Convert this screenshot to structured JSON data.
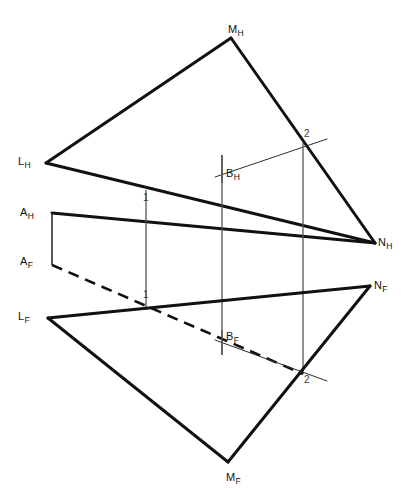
{
  "drawing": {
    "title": "Descriptive geometry: plane LMN with line AB, piercing points 1 and 2",
    "width": 412,
    "height": 501,
    "background": "#ffffff",
    "stroke_heavy": "#111111",
    "stroke_light": "#4a4a4a",
    "stroke_projector": "#555555"
  },
  "labels": {
    "m_h": {
      "text": "M",
      "sub": "H",
      "x": 228,
      "y": 24
    },
    "l_h": {
      "text": "L",
      "sub": "H",
      "x": 18,
      "y": 156
    },
    "n_h": {
      "text": "N",
      "sub": "H",
      "x": 378,
      "y": 237
    },
    "b_h": {
      "text": "B",
      "sub": "H",
      "x": 226,
      "y": 168
    },
    "a_h": {
      "text": "A",
      "sub": "H",
      "x": 20,
      "y": 207
    },
    "a_f": {
      "text": "A",
      "sub": "F",
      "x": 20,
      "y": 256
    },
    "l_f": {
      "text": "L",
      "sub": "F",
      "x": 18,
      "y": 311
    },
    "n_f": {
      "text": "N",
      "sub": "F",
      "x": 374,
      "y": 280
    },
    "b_f": {
      "text": "B",
      "sub": "F",
      "x": 226,
      "y": 331
    },
    "m_f": {
      "text": "M",
      "sub": "F",
      "x": 226,
      "y": 472
    },
    "one_h": {
      "text": "1",
      "x": 143,
      "y": 193
    },
    "two_h": {
      "text": "2",
      "x": 304,
      "y": 129
    },
    "one_f": {
      "text": "1",
      "x": 143,
      "y": 290
    },
    "two_f": {
      "text": "2",
      "x": 304,
      "y": 375
    }
  },
  "points": {
    "M_H": [
      231,
      38
    ],
    "L_H": [
      46,
      163
    ],
    "N_H": [
      375,
      243
    ],
    "A_H": [
      52,
      213
    ],
    "B_H": [
      222,
      175
    ],
    "P1_H": [
      146,
      190
    ],
    "P2_H": [
      303,
      143
    ],
    "A_F": [
      52,
      265
    ],
    "B_F": [
      222,
      338
    ],
    "L_F": [
      48,
      318
    ],
    "N_F": [
      370,
      286
    ],
    "M_F": [
      228,
      462
    ],
    "P1_F": [
      146,
      310
    ],
    "P2_F": [
      303,
      374
    ]
  },
  "geometry": {
    "top_triangle": "L_H - M_H - N_H - L_H",
    "front_triangle": "L_F - M_F - N_F - L_F",
    "top_line_ab": "A_H - B_H extended through 1 and 2",
    "front_line_ab": "A_F (dashed) - 1 - B_F (dashed) - 2 solid",
    "projectors": [
      {
        "name": "projector-A",
        "x": 52,
        "y1": 213,
        "y2": 265
      },
      {
        "name": "projector-1",
        "x": 146,
        "y1": 190,
        "y2": 310
      },
      {
        "name": "projector-B",
        "x": 222,
        "y1": 155,
        "y2": 355
      },
      {
        "name": "projector-2",
        "x": 303,
        "y1": 143,
        "y2": 374
      }
    ]
  }
}
